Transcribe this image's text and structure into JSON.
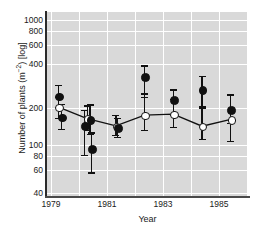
{
  "chart_data": {
    "type": "scatter",
    "title": "",
    "xlabel": "Year",
    "ylabel": "Number of plants (m⁻²) [log]",
    "yscale": "log",
    "ylim": [
      33,
      1150
    ],
    "xlim": [
      1978.6,
      1985.6
    ],
    "grid": true,
    "legend": "none",
    "ytick_labels": [
      "1000",
      "800",
      "600",
      "400",
      "200",
      "100",
      "80",
      "60",
      "40"
    ],
    "ytick_values": [
      1000,
      800,
      600,
      400,
      200,
      100,
      80,
      60,
      40
    ],
    "xtick_labels": [
      "1979",
      "1981",
      "1983",
      "1985"
    ],
    "xtick_values": [
      1979,
      1981,
      1983,
      1985
    ],
    "gridline_years": [
      1979,
      1980,
      1981,
      1982,
      1983,
      1984,
      1985,
      1986
    ],
    "series": [
      {
        "name": "open-circles",
        "marker": "open-circle",
        "connected": true,
        "x": [
          1979.0,
          1980.0,
          1981.0,
          1982.0,
          1983.0,
          1984.0,
          1985.0
        ],
        "values": [
          183,
          147,
          128,
          157,
          160,
          127,
          145
        ],
        "err_low": [
          150,
          118,
          108,
          118,
          125,
          100,
          96
        ],
        "err_high": [
          225,
          190,
          158,
          240,
          215,
          180,
          232
        ]
      },
      {
        "name": "filled-circles",
        "marker": "filled-circle",
        "connected": false,
        "x": [
          1979.0,
          1979.1,
          1979.9,
          1980.1,
          1980.15,
          1981.05,
          1982.0,
          1983.0,
          1984.0,
          1985.0
        ],
        "values": [
          228,
          152,
          128,
          145,
          83,
          124,
          330,
          212,
          258,
          175
        ],
        "err_low": [
          185,
          120,
          73,
          110,
          52,
          104,
          225,
          160,
          186,
          136
        ],
        "err_high": [
          283,
          196,
          175,
          193,
          113,
          150,
          410,
          258,
          335,
          238
        ]
      }
    ]
  }
}
